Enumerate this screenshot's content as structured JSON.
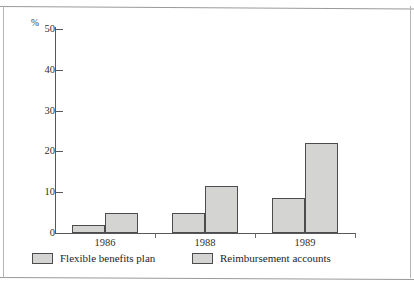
{
  "chart_data": {
    "type": "bar",
    "title": "",
    "subtitle": "",
    "xlabel": "",
    "ylabel": "%",
    "categories": [
      "1986",
      "1988",
      "1989"
    ],
    "series": [
      {
        "name": "Flexible benefits plan",
        "values": [
          2,
          5,
          8.5
        ],
        "color": "#d4d4d2"
      },
      {
        "name": "Reimbursement accounts",
        "values": [
          5,
          11.5,
          22
        ],
        "color": "#d4d4d2"
      }
    ],
    "ylim": [
      0,
      50
    ],
    "yticks": [
      0,
      10,
      20,
      30,
      40,
      50
    ],
    "ytick_labels": [
      "0",
      "10",
      "20",
      "30",
      "40",
      "50"
    ],
    "grid": false,
    "legend_position": "bottom"
  },
  "axis": {
    "unit_label": "%",
    "ticks": [
      {
        "label": "50",
        "value": 50
      },
      {
        "label": "40",
        "value": 40
      },
      {
        "label": "30",
        "value": 30
      },
      {
        "label": "20",
        "value": 20
      },
      {
        "label": "10",
        "value": 10
      },
      {
        "label": "0",
        "value": 0
      }
    ]
  },
  "legend": {
    "items": [
      {
        "label": "Flexible benefits plan"
      },
      {
        "label": "Reimbursement accounts"
      }
    ]
  }
}
